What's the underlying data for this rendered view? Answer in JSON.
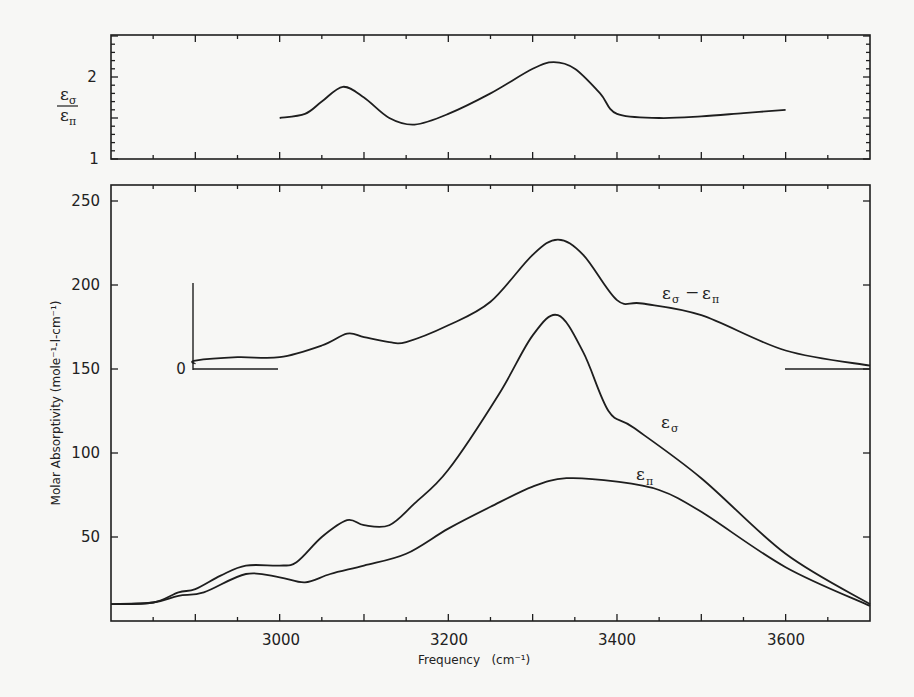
{
  "figure": {
    "top_panel": {
      "ylabel_numerator": "ε",
      "ylabel_numerator_sub": "σ",
      "ylabel_denominator": "ε",
      "ylabel_denominator_sub": "π",
      "yticks": [
        "1",
        "2"
      ]
    },
    "bottom_panel": {
      "ylabel": "Molar Absorptivity (mole⁻¹-l-cm⁻¹)",
      "xlabel": "Frequency   (cm⁻¹)",
      "yticks": [
        "50",
        "100",
        "150",
        "200",
        "250"
      ],
      "xticks": [
        "3000",
        "3200",
        "3400",
        "3600"
      ],
      "inset_zero_label": "0",
      "labels": {
        "diff": {
          "a": "ε",
          "a_sub": "σ",
          "op": "−",
          "b": "ε",
          "b_sub": "π"
        },
        "sigma": {
          "a": "ε",
          "a_sub": "σ"
        },
        "pi": {
          "a": "ε",
          "a_sub": "π"
        }
      }
    },
    "colors": {
      "line": "#1e1e1e",
      "background": "#f7f7f5"
    }
  },
  "chart_data": [
    {
      "type": "line",
      "title": "",
      "xlabel": "Frequency (cm⁻¹)",
      "ylabel": "εσ / επ",
      "xlim": [
        2800,
        3700
      ],
      "ylim": [
        1,
        2.5
      ],
      "yticks": [
        1,
        2
      ],
      "grid": false,
      "series": [
        {
          "name": "εσ/επ",
          "x": [
            3000,
            3030,
            3050,
            3075,
            3100,
            3130,
            3160,
            3200,
            3250,
            3300,
            3325,
            3350,
            3380,
            3400,
            3450,
            3500,
            3550,
            3600
          ],
          "y": [
            1.5,
            1.55,
            1.7,
            1.88,
            1.75,
            1.5,
            1.42,
            1.55,
            1.8,
            2.1,
            2.18,
            2.1,
            1.8,
            1.55,
            1.5,
            1.52,
            1.56,
            1.6
          ]
        }
      ]
    },
    {
      "type": "line",
      "title": "",
      "xlabel": "Frequency (cm⁻¹)",
      "ylabel": "Molar Absorptivity (mole⁻¹-l-cm⁻¹)",
      "xlim": [
        2800,
        3700
      ],
      "ylim": [
        0,
        260
      ],
      "xticks": [
        3000,
        3200,
        3400,
        3600
      ],
      "yticks": [
        50,
        100,
        150,
        200,
        250
      ],
      "grid": false,
      "series": [
        {
          "name": "εσ",
          "x": [
            2800,
            2850,
            2880,
            2900,
            2930,
            2960,
            3000,
            3020,
            3050,
            3080,
            3100,
            3130,
            3160,
            3200,
            3260,
            3300,
            3330,
            3360,
            3390,
            3420,
            3500,
            3600,
            3700
          ],
          "y": [
            10,
            11,
            17,
            19,
            27,
            33,
            33,
            35,
            50,
            60,
            57,
            57,
            70,
            90,
            135,
            170,
            182,
            160,
            125,
            115,
            85,
            40,
            10
          ]
        },
        {
          "name": "επ",
          "x": [
            2800,
            2850,
            2880,
            2910,
            2960,
            3000,
            3030,
            3060,
            3100,
            3150,
            3200,
            3250,
            3300,
            3340,
            3400,
            3450,
            3500,
            3600,
            3700
          ],
          "y": [
            10,
            11,
            15,
            17,
            28,
            26,
            23,
            28,
            33,
            40,
            55,
            68,
            80,
            85,
            83,
            78,
            65,
            32,
            9
          ]
        },
        {
          "name": "εσ − επ (offset; zero at 150 on left scale)",
          "x": [
            2900,
            2950,
            3000,
            3050,
            3080,
            3100,
            3130,
            3150,
            3200,
            3250,
            3300,
            3330,
            3360,
            3400,
            3430,
            3500,
            3600,
            3700
          ],
          "y": [
            5,
            7,
            7,
            14,
            21,
            19,
            16,
            16,
            26,
            40,
            68,
            77,
            68,
            41,
            39,
            32,
            11,
            2
          ]
        }
      ],
      "annotations": [
        "εσ − επ",
        "εσ",
        "επ",
        "0"
      ]
    }
  ]
}
